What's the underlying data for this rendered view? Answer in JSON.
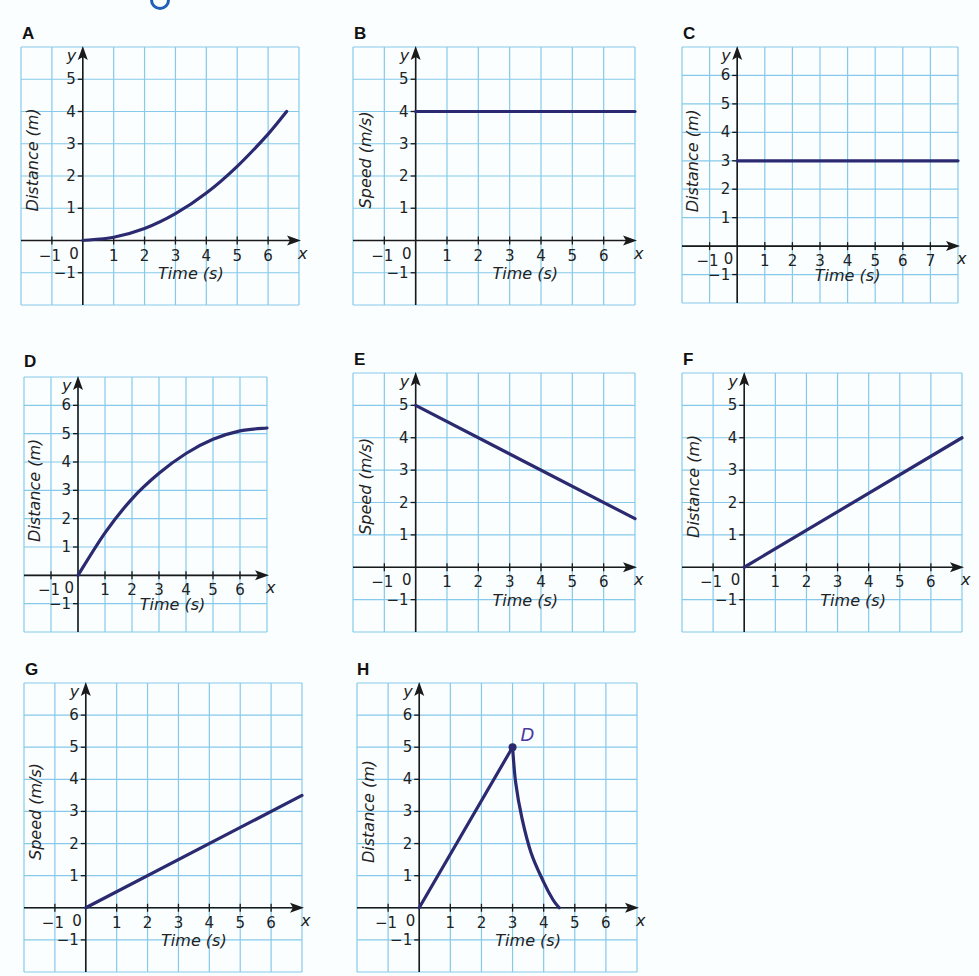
{
  "page": {
    "background": "#fbfeff",
    "colors": {
      "grid": "#86c9ea",
      "grid_border": "#86c9ea",
      "axis": "#1a1a1a",
      "curve": "#2b2a70",
      "point_label": "#4a3aa0"
    }
  },
  "chart_data": [
    {
      "id": "A",
      "type": "line",
      "title": "A",
      "xlabel": "Time (s)",
      "ylabel": "Distance (m)",
      "x_tick_labels": [
        "1",
        "2",
        "3",
        "4",
        "5",
        "6"
      ],
      "y_tick_labels": [
        "1",
        "2",
        "3",
        "4",
        "5"
      ],
      "neg_labels": {
        "x": "−1",
        "y": "−1",
        "origin": "0"
      },
      "xlim": [
        -2,
        7
      ],
      "ylim": [
        -2,
        6
      ],
      "grid": true,
      "axis_names": {
        "x": "x",
        "y": "y"
      },
      "series": [
        {
          "name": "curve",
          "shape": "quadratic-increasing",
          "x": [
            0,
            1,
            2,
            3,
            4,
            5,
            6,
            6.6
          ],
          "y": [
            0,
            0.1,
            0.37,
            0.83,
            1.47,
            2.3,
            3.3,
            4.0
          ]
        }
      ]
    },
    {
      "id": "B",
      "type": "line",
      "title": "B",
      "xlabel": "Time (s)",
      "ylabel": "Speed (m/s)",
      "x_tick_labels": [
        "1",
        "2",
        "3",
        "4",
        "5",
        "6"
      ],
      "y_tick_labels": [
        "1",
        "2",
        "3",
        "4",
        "5"
      ],
      "neg_labels": {
        "x": "−1",
        "y": "−1",
        "origin": "0"
      },
      "xlim": [
        -2,
        7
      ],
      "ylim": [
        -2,
        6
      ],
      "grid": true,
      "axis_names": {
        "x": "x",
        "y": "y"
      },
      "series": [
        {
          "name": "line",
          "shape": "horizontal",
          "x": [
            0,
            7
          ],
          "y": [
            4,
            4
          ]
        }
      ]
    },
    {
      "id": "C",
      "type": "line",
      "title": "C",
      "xlabel": "Time (s)",
      "ylabel": "Distance (m)",
      "x_tick_labels": [
        "1",
        "2",
        "3",
        "4",
        "5",
        "6",
        "7"
      ],
      "y_tick_labels": [
        "1",
        "2",
        "3",
        "4",
        "5",
        "6"
      ],
      "neg_labels": {
        "x": "−1",
        "y": "−1",
        "origin": "0"
      },
      "xlim": [
        -2,
        8
      ],
      "ylim": [
        -2,
        7
      ],
      "grid": true,
      "axis_names": {
        "x": "x",
        "y": "y"
      },
      "series": [
        {
          "name": "line",
          "shape": "horizontal",
          "x": [
            0,
            8
          ],
          "y": [
            3,
            3
          ]
        }
      ]
    },
    {
      "id": "D",
      "type": "line",
      "title": "D",
      "xlabel": "Time (s)",
      "ylabel": "Distance (m)",
      "x_tick_labels": [
        "1",
        "2",
        "3",
        "4",
        "5",
        "6"
      ],
      "y_tick_labels": [
        "1",
        "2",
        "3",
        "4",
        "5",
        "6"
      ],
      "neg_labels": {
        "x": "−1",
        "y": "−1",
        "origin": "0"
      },
      "xlim": [
        -2,
        7
      ],
      "ylim": [
        -2,
        7
      ],
      "grid": true,
      "axis_names": {
        "x": "x",
        "y": "y"
      },
      "series": [
        {
          "name": "curve",
          "shape": "concave-increasing",
          "x": [
            0,
            1,
            2,
            3,
            4,
            5,
            6,
            7
          ],
          "y": [
            0,
            1.5,
            2.7,
            3.6,
            4.3,
            4.8,
            5.1,
            5.2
          ]
        }
      ]
    },
    {
      "id": "E",
      "type": "line",
      "title": "E",
      "xlabel": "Time (s)",
      "ylabel": "Speed (m/s)",
      "x_tick_labels": [
        "1",
        "2",
        "3",
        "4",
        "5",
        "6"
      ],
      "y_tick_labels": [
        "1",
        "2",
        "3",
        "4",
        "5"
      ],
      "neg_labels": {
        "x": "−1",
        "y": "−1",
        "origin": "0"
      },
      "xlim": [
        -2,
        7
      ],
      "ylim": [
        -2,
        6
      ],
      "grid": true,
      "axis_names": {
        "x": "x",
        "y": "y"
      },
      "series": [
        {
          "name": "line",
          "shape": "linear-decreasing",
          "x": [
            0,
            7
          ],
          "y": [
            5,
            1.5
          ]
        }
      ]
    },
    {
      "id": "F",
      "type": "line",
      "title": "F",
      "xlabel": "Time (s)",
      "ylabel": "Distance (m)",
      "x_tick_labels": [
        "1",
        "2",
        "3",
        "4",
        "5",
        "6"
      ],
      "y_tick_labels": [
        "1",
        "2",
        "3",
        "4",
        "5"
      ],
      "neg_labels": {
        "x": "−1",
        "y": "−1",
        "origin": "0"
      },
      "xlim": [
        -2,
        7
      ],
      "ylim": [
        -2,
        6
      ],
      "grid": true,
      "axis_names": {
        "x": "x",
        "y": "y"
      },
      "series": [
        {
          "name": "line",
          "shape": "linear-increasing",
          "x": [
            0,
            7
          ],
          "y": [
            0,
            4
          ]
        }
      ]
    },
    {
      "id": "G",
      "type": "line",
      "title": "G",
      "xlabel": "Time (s)",
      "ylabel": "Speed (m/s)",
      "x_tick_labels": [
        "1",
        "2",
        "3",
        "4",
        "5",
        "6"
      ],
      "y_tick_labels": [
        "1",
        "2",
        "3",
        "4",
        "5",
        "6"
      ],
      "neg_labels": {
        "x": "−1",
        "y": "−1",
        "origin": "0"
      },
      "xlim": [
        -2,
        7
      ],
      "ylim": [
        -2,
        7
      ],
      "grid": true,
      "axis_names": {
        "x": "x",
        "y": "y"
      },
      "series": [
        {
          "name": "line",
          "shape": "linear-increasing",
          "x": [
            0,
            7
          ],
          "y": [
            0,
            3.5
          ]
        }
      ]
    },
    {
      "id": "H",
      "type": "line",
      "title": "H",
      "xlabel": "Time (s)",
      "ylabel": "Distance (m)",
      "x_tick_labels": [
        "1",
        "2",
        "3",
        "4",
        "5",
        "6"
      ],
      "y_tick_labels": [
        "1",
        "2",
        "3",
        "4",
        "5",
        "6"
      ],
      "neg_labels": {
        "x": "−1",
        "y": "−1",
        "origin": "0"
      },
      "xlim": [
        -2,
        7
      ],
      "ylim": [
        -2,
        7
      ],
      "grid": true,
      "axis_names": {
        "x": "x",
        "y": "y"
      },
      "series": [
        {
          "name": "rise",
          "shape": "linear-increasing",
          "x": [
            0,
            3
          ],
          "y": [
            0,
            5
          ]
        },
        {
          "name": "fall",
          "shape": "convex-decreasing",
          "x": [
            3,
            3.1,
            3.3,
            3.6,
            4.0,
            4.3,
            4.5
          ],
          "y": [
            5,
            3.9,
            2.8,
            1.7,
            0.8,
            0.25,
            0
          ]
        }
      ],
      "annotations": [
        {
          "type": "point",
          "x": 3,
          "y": 5,
          "label": "D"
        }
      ]
    }
  ]
}
